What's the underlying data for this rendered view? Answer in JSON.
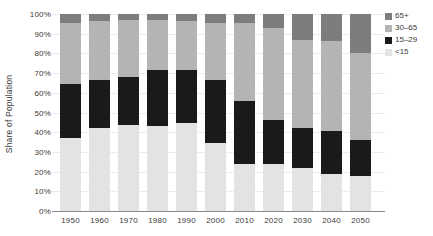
{
  "chart_data": {
    "type": "bar",
    "stacked": true,
    "title": "",
    "xlabel": "",
    "ylabel": "Share of Population",
    "ylim": [
      0,
      100
    ],
    "yticks": [
      0,
      10,
      20,
      30,
      40,
      50,
      60,
      70,
      80,
      90,
      100
    ],
    "ytick_suffix": "%",
    "grid": true,
    "categories": [
      "1950",
      "1960",
      "1970",
      "1980",
      "1990",
      "2000",
      "2010",
      "2020",
      "2030",
      "2040",
      "2050"
    ],
    "series": [
      {
        "name": "<15",
        "color": "#e3e3e3",
        "values": [
          37.0,
          42.0,
          43.5,
          43.0,
          44.5,
          34.5,
          24.0,
          24.0,
          22.0,
          19.0,
          18.0
        ]
      },
      {
        "name": "15–29",
        "color": "#1a1a1a",
        "values": [
          27.5,
          24.5,
          24.5,
          28.5,
          27.0,
          32.0,
          32.0,
          22.0,
          20.0,
          21.5,
          18.0
        ]
      },
      {
        "name": "30–65",
        "color": "#b4b4b4",
        "values": [
          31.0,
          30.0,
          29.0,
          25.5,
          25.0,
          29.0,
          39.5,
          47.0,
          45.0,
          46.0,
          44.0
        ]
      },
      {
        "name": "65+",
        "color": "#7d7d7d",
        "values": [
          4.5,
          3.5,
          3.0,
          3.0,
          3.5,
          4.5,
          4.5,
          7.0,
          13.0,
          13.5,
          20.0
        ]
      }
    ],
    "legend": {
      "position": "top-right",
      "order": [
        "65+",
        "30–65",
        "15–29",
        "<15"
      ]
    }
  },
  "colors": {
    "background": "#ffffff",
    "axis_line": "#8a8a8a",
    "gridline": "#ebebeb",
    "text": "#3a3a3a"
  }
}
